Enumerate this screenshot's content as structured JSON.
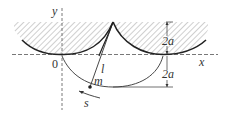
{
  "figure": {
    "type": "cycloidal pendulum diagram",
    "labels": {
      "y_axis": "y",
      "x_axis": "x",
      "origin": "0",
      "string_length": "l",
      "mass": "m",
      "arc_length": "s",
      "upper_height": "2a",
      "lower_height": "2a"
    },
    "colors": {
      "line": "#333333",
      "hatch": "#9a9a9a",
      "background": "#ffffff"
    }
  }
}
